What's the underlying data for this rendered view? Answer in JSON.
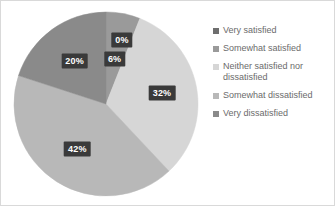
{
  "chart_data": {
    "type": "pie",
    "title": "",
    "categories": [
      "Very satisfied",
      "Somewhat satisfied",
      "Neither satisfied nor dissatisfied",
      "Somewhat dissatisfied",
      "Very dissatisfied"
    ],
    "values": [
      0,
      6,
      32,
      42,
      20
    ],
    "data_labels": [
      "0%",
      "6%",
      "32%",
      "42%",
      "20%"
    ],
    "colors": [
      "#6e6e6e",
      "#9a9a9a",
      "#d6d6d6",
      "#b8b8b8",
      "#8a8a8a"
    ],
    "legend_position": "right",
    "grid": false,
    "start_angle_deg": 0,
    "direction": "clockwise",
    "slices": [
      {
        "label": "Very satisfied",
        "value": 0,
        "data_label": "0%",
        "color": "#6e6e6e"
      },
      {
        "label": "Somewhat satisfied",
        "value": 6,
        "data_label": "6%",
        "color": "#9a9a9a"
      },
      {
        "label": "Neither satisfied nor dissatisfied",
        "value": 32,
        "data_label": "32%",
        "color": "#d6d6d6"
      },
      {
        "label": "Somewhat dissatisfied",
        "value": 42,
        "data_label": "42%",
        "color": "#b8b8b8"
      },
      {
        "label": "Very dissatisfied",
        "value": 20,
        "data_label": "20%",
        "color": "#8a8a8a"
      }
    ]
  },
  "legend": {
    "items": [
      {
        "label": "Very satisfied",
        "color": "#6e6e6e"
      },
      {
        "label": "Somewhat satisfied",
        "color": "#9a9a9a"
      },
      {
        "label": "Neither satisfied nor dissatisfied",
        "color": "#d6d6d6"
      },
      {
        "label": "Somewhat dissatisfied",
        "color": "#b8b8b8"
      },
      {
        "label": "Very dissatisfied",
        "color": "#8a8a8a"
      }
    ]
  },
  "style": {
    "background": "#ffffff",
    "border_color": "#d9d9d9",
    "label_background": "#3a3a3a",
    "label_text_color": "#ffffff",
    "legend_text_color": "#6b6b6b"
  }
}
